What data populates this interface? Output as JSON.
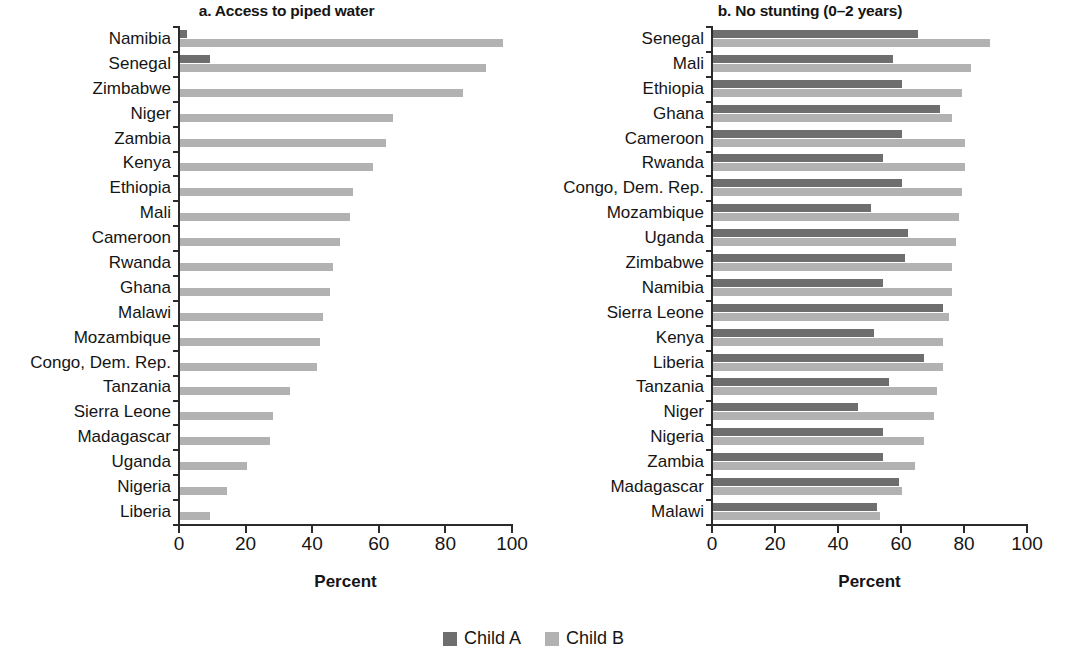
{
  "figure": {
    "x_axis_title": "Percent"
  },
  "legend": {
    "items": [
      {
        "label": "Child A",
        "color": "#6e6e6e",
        "name": "legend-child-a"
      },
      {
        "label": "Child B",
        "color": "#b2b2b2",
        "name": "legend-child-b"
      }
    ]
  },
  "panel_a": {
    "title": "a. Access to piped water",
    "xlabel": "Percent"
  },
  "panel_b": {
    "title": "b. No stunting (0–2 years)",
    "xlabel": "Percent"
  },
  "chart_data": [
    {
      "type": "bar",
      "orientation": "horizontal",
      "title": "a. Access to piped water",
      "xlabel": "Percent",
      "ylabel": "",
      "xlim": [
        0,
        100
      ],
      "xticks": [
        0,
        20,
        40,
        60,
        80,
        100
      ],
      "grid": false,
      "legend_position": "bottom-center",
      "categories": [
        "Namibia",
        "Senegal",
        "Zimbabwe",
        "Niger",
        "Zambia",
        "Kenya",
        "Ethiopia",
        "Mali",
        "Cameroon",
        "Rwanda",
        "Ghana",
        "Malawi",
        "Mozambique",
        "Congo, Dem. Rep.",
        "Tanzania",
        "Sierra Leone",
        "Madagascar",
        "Uganda",
        "Nigeria",
        "Liberia"
      ],
      "series": [
        {
          "name": "Child A",
          "color": "#6e6e6e",
          "values": [
            2,
            9,
            0,
            0,
            0,
            0,
            0,
            0,
            0,
            0,
            0,
            0,
            0,
            0,
            0,
            0,
            0,
            0,
            0,
            0
          ]
        },
        {
          "name": "Child B",
          "color": "#b2b2b2",
          "values": [
            97,
            92,
            85,
            64,
            62,
            58,
            52,
            51,
            48,
            46,
            45,
            43,
            42,
            41,
            33,
            28,
            27,
            20,
            14,
            9
          ]
        }
      ]
    },
    {
      "type": "bar",
      "orientation": "horizontal",
      "title": "b. No stunting (0–2 years)",
      "xlabel": "Percent",
      "ylabel": "",
      "xlim": [
        0,
        100
      ],
      "xticks": [
        0,
        20,
        40,
        60,
        80,
        100
      ],
      "grid": false,
      "legend_position": "bottom-center",
      "categories": [
        "Senegal",
        "Mali",
        "Ethiopia",
        "Ghana",
        "Cameroon",
        "Rwanda",
        "Congo, Dem. Rep.",
        "Mozambique",
        "Uganda",
        "Zimbabwe",
        "Namibia",
        "Sierra Leone",
        "Kenya",
        "Liberia",
        "Tanzania",
        "Niger",
        "Nigeria",
        "Zambia",
        "Madagascar",
        "Malawi"
      ],
      "series": [
        {
          "name": "Child A",
          "color": "#6e6e6e",
          "values": [
            65,
            57,
            60,
            72,
            60,
            54,
            60,
            50,
            62,
            61,
            54,
            73,
            51,
            67,
            56,
            46,
            54,
            54,
            59,
            52
          ]
        },
        {
          "name": "Child B",
          "color": "#b2b2b2",
          "values": [
            88,
            82,
            79,
            76,
            80,
            80,
            79,
            78,
            77,
            76,
            76,
            75,
            73,
            73,
            71,
            70,
            67,
            64,
            60,
            53
          ]
        }
      ]
    }
  ]
}
